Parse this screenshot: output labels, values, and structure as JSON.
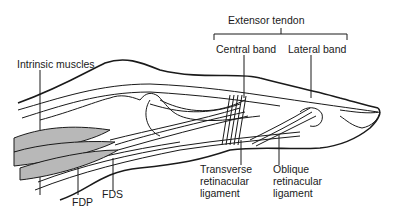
{
  "diagram": {
    "labels": {
      "extensor_tendon": "Extensor tendon",
      "central_band": "Central band",
      "lateral_band": "Lateral band",
      "intrinsic_muscles": "Intrinsic muscles",
      "fdp": "FDP",
      "fds": "FDS",
      "transverse_retinacular_ligament": "Transverse\nretinacular\nligament",
      "oblique_retinacular_ligament": "Oblique\nretinacular\nligament"
    },
    "colors": {
      "line": "#1a1a1a",
      "muscle_fill": "#b8b8b8",
      "background": "#ffffff"
    }
  }
}
